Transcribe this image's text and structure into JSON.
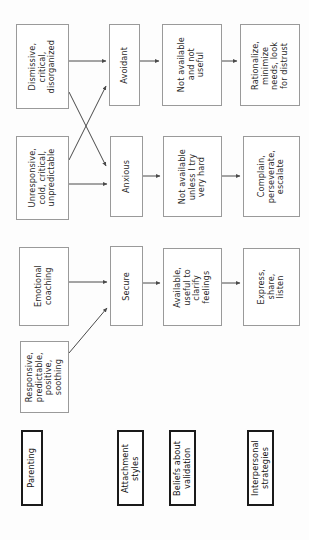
{
  "diagram": {
    "orientation": "rotated-90-ccw",
    "background_color": "#fdfdfd",
    "box_border_color": "#9a9a9a",
    "legend_border_color": "#1a1a1a",
    "arrow_color": "#4a4a4a",
    "columns": [
      {
        "key": "parenting",
        "legend": "Parenting"
      },
      {
        "key": "attachment_styles",
        "legend": "Attachment\nstyles"
      },
      {
        "key": "beliefs_about_validation",
        "legend": "Beliefs about\nvalidation"
      },
      {
        "key": "interpersonal_strategies",
        "legend": "Interpersonal\nstrategies"
      }
    ],
    "nodes": [
      {
        "id": "parenting-dismissive",
        "text": "Dismissive,\ncritical,\ndisorganized",
        "x": 16,
        "y": 24,
        "w": 53,
        "h": 85
      },
      {
        "id": "parenting-unresponsive",
        "text": "Unresponsive,\ncold, critical,\nunpredictable",
        "x": 16,
        "y": 136,
        "w": 53,
        "h": 84
      },
      {
        "id": "parenting-emotional-coaching",
        "text": "Emotional\ncoaching",
        "x": 19,
        "y": 247,
        "w": 50,
        "h": 79
      },
      {
        "id": "parenting-responsive",
        "text": "Responsive,\npredictable,\npositive,\nsoothing",
        "x": 20,
        "y": 341,
        "w": 49,
        "h": 72
      },
      {
        "id": "attachment-avoidant",
        "text": "Avoidant",
        "x": 109,
        "y": 24,
        "w": 31,
        "h": 82
      },
      {
        "id": "attachment-anxious",
        "text": "Anxious",
        "x": 110,
        "y": 136,
        "w": 33,
        "h": 81
      },
      {
        "id": "attachment-secure",
        "text": "Secure",
        "x": 110,
        "y": 246,
        "w": 33,
        "h": 80
      },
      {
        "id": "beliefs-not-available-not-useful",
        "text": "Not available\nand not\nuseful",
        "x": 162,
        "y": 24,
        "w": 60,
        "h": 82
      },
      {
        "id": "beliefs-not-available-unless",
        "text": "Not available\nunless I try\nvery hard",
        "x": 163,
        "y": 136,
        "w": 59,
        "h": 81
      },
      {
        "id": "beliefs-available-useful",
        "text": "Available,\nuseful to\nclarify\nfeelings",
        "x": 163,
        "y": 248,
        "w": 59,
        "h": 78
      },
      {
        "id": "strategies-rationalize",
        "text": "Rationalize,\nminimize\nneeds, look\nfor distrust",
        "x": 240,
        "y": 24,
        "w": 60,
        "h": 82
      },
      {
        "id": "strategies-complain",
        "text": "Complain,\nperseverate,\nescalate",
        "x": 243,
        "y": 136,
        "w": 57,
        "h": 81
      },
      {
        "id": "strategies-express",
        "text": "Express,\nshare,\nlisten",
        "x": 243,
        "y": 248,
        "w": 57,
        "h": 78
      }
    ],
    "legend_nodes": [
      {
        "id": "legend-parenting",
        "text": "Parenting",
        "x": 21,
        "y": 430,
        "w": 22,
        "h": 76
      },
      {
        "id": "legend-attachment-styles",
        "text": "Attachment\nstyles",
        "x": 117,
        "y": 430,
        "w": 27,
        "h": 76
      },
      {
        "id": "legend-beliefs",
        "text": "Beliefs about\nvalidation",
        "x": 169,
        "y": 430,
        "w": 27,
        "h": 76
      },
      {
        "id": "legend-strategies",
        "text": "Interpersonal\nstrategies",
        "x": 247,
        "y": 430,
        "w": 27,
        "h": 76
      }
    ],
    "edges": [
      {
        "id": "edge-dismissive-to-avoidant",
        "from": "parenting-dismissive",
        "to": "attachment-avoidant",
        "type": "straight",
        "path": "M 69 61 L 106 61"
      },
      {
        "id": "edge-dismissive-to-anxious",
        "from": "parenting-dismissive",
        "to": "attachment-anxious",
        "type": "diagonal",
        "path": "M 69 92 L 106 166"
      },
      {
        "id": "edge-unresponsive-to-avoidant",
        "from": "parenting-unresponsive",
        "to": "attachment-avoidant",
        "type": "diagonal",
        "path": "M 69 160 L 106 86"
      },
      {
        "id": "edge-unresponsive-to-anxious",
        "from": "parenting-unresponsive",
        "to": "attachment-anxious",
        "type": "straight",
        "path": "M 69 184 L 107 184"
      },
      {
        "id": "edge-coaching-to-secure",
        "from": "parenting-emotional-coaching",
        "to": "attachment-secure",
        "type": "straight",
        "path": "M 69 282 L 107 282"
      },
      {
        "id": "edge-responsive-to-secure",
        "from": "parenting-responsive",
        "to": "attachment-secure",
        "type": "diagonal",
        "path": "M 69 353 L 107 308"
      },
      {
        "id": "edge-avoidant-to-beliefs",
        "from": "attachment-avoidant",
        "to": "beliefs-not-available-not-useful",
        "type": "straight",
        "path": "M 140 61 L 159 61"
      },
      {
        "id": "edge-anxious-to-beliefs",
        "from": "attachment-anxious",
        "to": "beliefs-not-available-unless",
        "type": "straight",
        "path": "M 143 176 L 160 176"
      },
      {
        "id": "edge-secure-to-beliefs",
        "from": "attachment-secure",
        "to": "beliefs-available-useful",
        "type": "straight",
        "path": "M 143 283 L 160 283"
      },
      {
        "id": "edge-beliefs1-to-strategies1",
        "from": "beliefs-not-available-not-useful",
        "to": "strategies-rationalize",
        "type": "straight",
        "path": "M 222 61 L 237 61"
      },
      {
        "id": "edge-beliefs2-to-strategies2",
        "from": "beliefs-not-available-unless",
        "to": "strategies-complain",
        "type": "straight",
        "path": "M 222 176 L 240 176"
      },
      {
        "id": "edge-beliefs3-to-strategies3",
        "from": "beliefs-available-useful",
        "to": "strategies-express",
        "type": "straight",
        "path": "M 222 283 L 240 283"
      }
    ]
  }
}
